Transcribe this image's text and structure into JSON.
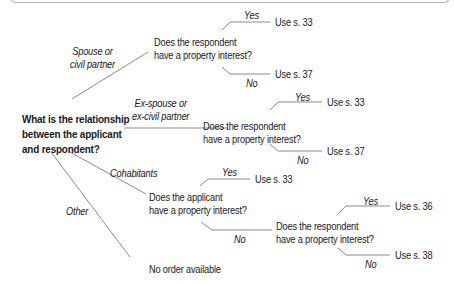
{
  "root": {
    "lines": [
      "What is the relationship",
      "between the applicant",
      "and respondent?"
    ]
  },
  "branches": [
    {
      "label_lines": [
        "Spouse or",
        "civil partner"
      ],
      "question_lines": [
        "Does the respondent",
        "have a property interest?"
      ],
      "yes_label": "Yes",
      "yes_outcome": "Use s. 33",
      "no_label": "No",
      "no_outcome": "Use s. 37"
    },
    {
      "label_lines": [
        "Ex-spouse or",
        "ex-civil partner"
      ],
      "question_lines": [
        "Does the respondent",
        "have a property interest?"
      ],
      "yes_label": "Yes",
      "yes_outcome": "Use s. 33",
      "no_label": "No",
      "no_outcome": "Use s. 37"
    },
    {
      "label_lines": [
        "Cohabitants"
      ],
      "question_lines": [
        "Does the applicant",
        "have a property interest?"
      ],
      "yes_label": "Yes",
      "yes_outcome": "Use s. 33",
      "no_label": "No",
      "sub_question_lines": [
        "Does the respondent",
        "have a property interest?"
      ],
      "sub_yes_label": "Yes",
      "sub_yes_outcome": "Use s. 36",
      "sub_no_label": "No",
      "sub_no_outcome": "Use s. 38"
    },
    {
      "label_lines": [
        "Other"
      ],
      "outcome": "No order available"
    }
  ],
  "colors": {
    "line": "#8a8a8a",
    "text": "#1a1a1a",
    "frame": "#b5b5b5"
  }
}
